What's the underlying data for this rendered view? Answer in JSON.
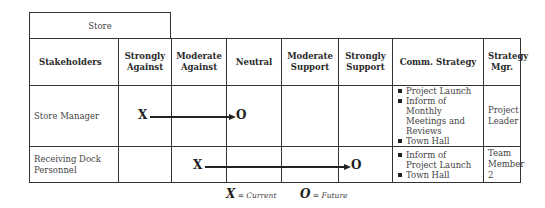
{
  "title_box": "Store",
  "headers": [
    "Stakeholders",
    "Strongly Against",
    "Moderate Against",
    "Neutral",
    "Moderate Support",
    "Strongly Support",
    "Comm. Strategy",
    "Strategy Mgr."
  ],
  "rows": [
    {
      "stakeholder": "Store Manager",
      "current": "Strongly Against",
      "future": "Neutral",
      "current_marker": "X",
      "future_marker": "O",
      "comm_strategy": [
        "Project Launch",
        "Inform of Monthly Meetings and Reviews",
        "Town Hall"
      ],
      "strategy_mgr": "Project Leader"
    },
    {
      "stakeholder": "Receiving Dock Personnel",
      "current": "Moderate Against",
      "future": "Strongly Support",
      "current_marker": "X",
      "future_marker": "O",
      "comm_strategy": [
        "Inform of Project Launch",
        "Town Hall"
      ],
      "strategy_mgr": "Team Member 2"
    }
  ],
  "legend": {
    "current_symbol": "X",
    "current_label": "= Current",
    "future_symbol": "O",
    "future_label": "= Future"
  }
}
